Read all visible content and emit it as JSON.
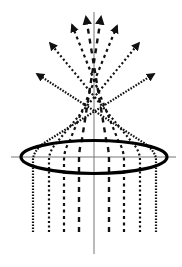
{
  "diagram": {
    "colors": {
      "background": "#ffffff",
      "axis": "#777777",
      "lens": "#000000",
      "ray": "#111111"
    },
    "axes": {
      "vertical": {
        "x": 94,
        "y1": 12,
        "y2": 254
      },
      "horizontal": {
        "y": 157,
        "x1": 11,
        "x2": 176
      }
    },
    "lens": {
      "cx": 94,
      "cy": 157,
      "rx": 73,
      "ry": 16.5,
      "stroke_width": 3.2
    },
    "rays": [
      {
        "side": "left",
        "x": 33,
        "bend_y": 160,
        "exit": [
          44,
          143
        ],
        "arrow": [
          154,
          74
        ],
        "dash": "1.6 1.4",
        "width": 2.2
      },
      {
        "side": "left",
        "x": 49,
        "bend_y": 160,
        "exit": [
          58,
          141
        ],
        "arrow": [
          139,
          43
        ],
        "dash": "2 2.5",
        "width": 2.2
      },
      {
        "side": "left",
        "x": 64,
        "bend_y": 160,
        "exit": [
          70,
          140
        ],
        "arrow": [
          117,
          26
        ],
        "dash": "3 3.5",
        "width": 2.2
      },
      {
        "side": "left",
        "x": 79,
        "bend_y": 160,
        "exit": [
          82,
          139
        ],
        "arrow": [
          101,
          17
        ],
        "dash": "5 5",
        "width": 2.4
      },
      {
        "side": "right",
        "x": 109,
        "bend_y": 160,
        "exit": [
          106,
          139
        ],
        "arrow": [
          86,
          17
        ],
        "dash": "5 5",
        "width": 2.4
      },
      {
        "side": "right",
        "x": 124,
        "bend_y": 160,
        "exit": [
          118,
          140
        ],
        "arrow": [
          72,
          25
        ],
        "dash": "3 3.5",
        "width": 2.2
      },
      {
        "side": "right",
        "x": 140,
        "bend_y": 160,
        "exit": [
          131,
          141
        ],
        "arrow": [
          50,
          43
        ],
        "dash": "2 2.5",
        "width": 2.2
      },
      {
        "side": "right",
        "x": 156,
        "bend_y": 160,
        "exit": [
          144,
          143
        ],
        "arrow": [
          37,
          74
        ],
        "dash": "1.6 1.4",
        "width": 2.2
      }
    ],
    "ray_bottom_y": 232
  }
}
